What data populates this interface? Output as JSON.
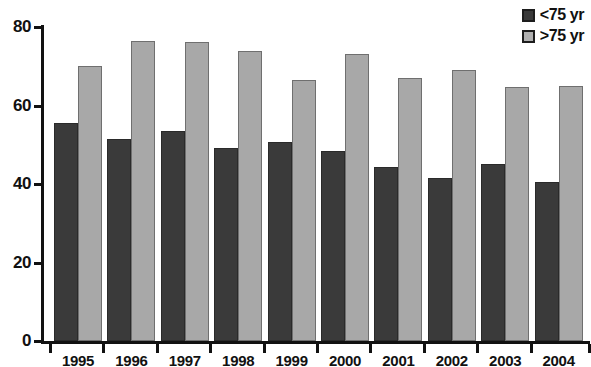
{
  "chart_data": {
    "type": "bar",
    "title": "",
    "xlabel": "",
    "ylabel": "",
    "ylim": [
      0,
      80
    ],
    "yticks": [
      0,
      20,
      40,
      60,
      80
    ],
    "grid": false,
    "legend_position": "top-right",
    "categories": [
      "1995",
      "1996",
      "1997",
      "1998",
      "1999",
      "2000",
      "2001",
      "2002",
      "2003",
      "2004"
    ],
    "series": [
      {
        "name": "<75 yr",
        "color": "#3a3a3a",
        "values": [
          55.5,
          51.5,
          53.5,
          49.3,
          50.8,
          48.3,
          44.3,
          41.5,
          45.0,
          40.5
        ]
      },
      {
        "name": ">75 yr",
        "color": "#a8a8a8",
        "values": [
          70.0,
          76.5,
          76.3,
          74.0,
          66.5,
          73.0,
          67.0,
          69.0,
          64.8,
          65.0
        ]
      }
    ]
  }
}
